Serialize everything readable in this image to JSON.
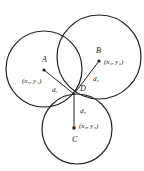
{
  "diagram": {
    "circles": [
      {
        "name": "A",
        "cx": 44,
        "cy": 69,
        "r": 38
      },
      {
        "name": "B",
        "cx": 99,
        "cy": 57,
        "r": 42
      },
      {
        "name": "C",
        "cx": 77,
        "cy": 129,
        "r": 35
      }
    ],
    "points": {
      "A": {
        "label": "A",
        "coord": "(x₁, y₁)",
        "x": 44,
        "y": 70
      },
      "B": {
        "label": "B",
        "coord": "(x₂, y₂)",
        "x": 99,
        "y": 61
      },
      "C": {
        "label": "C",
        "coord": "(x₃, y₃)",
        "x": 74,
        "y": 128
      },
      "D": {
        "label": "D",
        "x": 74,
        "y": 94
      }
    },
    "distances": {
      "d1": "d₁",
      "d2": "d₂",
      "d3": "d₃"
    },
    "stroke_color": "#222222"
  }
}
